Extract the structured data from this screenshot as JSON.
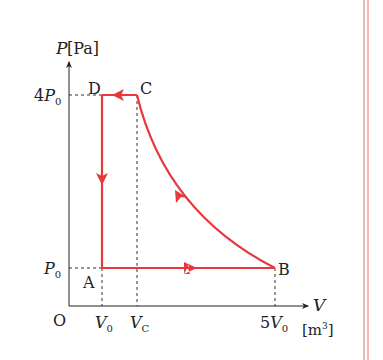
{
  "diagram": {
    "type": "PV cycle",
    "y_axis": {
      "symbol": "P",
      "unit": "[Pa]"
    },
    "x_axis": {
      "symbol": "V",
      "unit": "[m³]"
    },
    "origin": "O",
    "y_ticks": [
      {
        "label": "4P",
        "sub": "0"
      },
      {
        "label": "P",
        "sub": "0"
      }
    ],
    "x_ticks": [
      {
        "label": "V",
        "sub": "0"
      },
      {
        "label": "V",
        "sub": "C"
      },
      {
        "label": "5V",
        "sub": "0"
      }
    ],
    "points": [
      {
        "name": "A",
        "V": "V0",
        "P": "P0"
      },
      {
        "name": "B",
        "V": "5V0",
        "P": "P0"
      },
      {
        "name": "C",
        "V": "VC",
        "P": "4P0"
      },
      {
        "name": "D",
        "V": "V0",
        "P": "4P0"
      }
    ],
    "process_order": [
      "A→B",
      "B→C (curve)",
      "C→D",
      "D→A"
    ],
    "line_color": "#e8383d"
  }
}
